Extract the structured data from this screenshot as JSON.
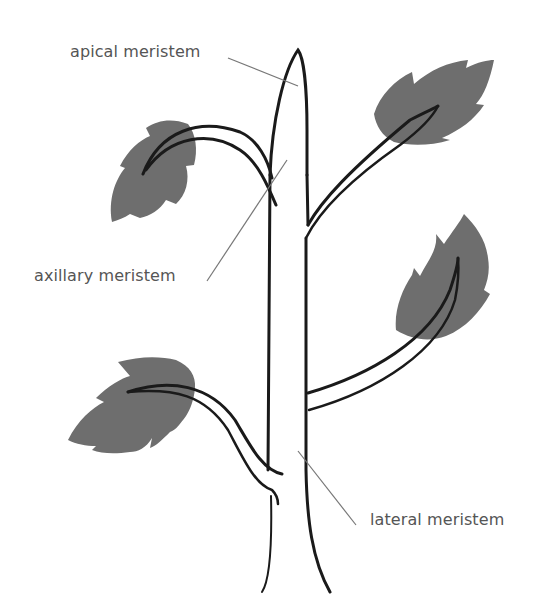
{
  "diagram": {
    "colors": {
      "background": "#ffffff",
      "outline": "#1a1a1a",
      "leaf": "#6e6e6e",
      "label_text": "#555555",
      "leader_line": "#777777"
    },
    "labels": [
      {
        "id": "apical",
        "text": "apical meristem"
      },
      {
        "id": "axillary",
        "text": "axillary meristem"
      },
      {
        "id": "lateral",
        "text": "lateral meristem"
      }
    ]
  }
}
